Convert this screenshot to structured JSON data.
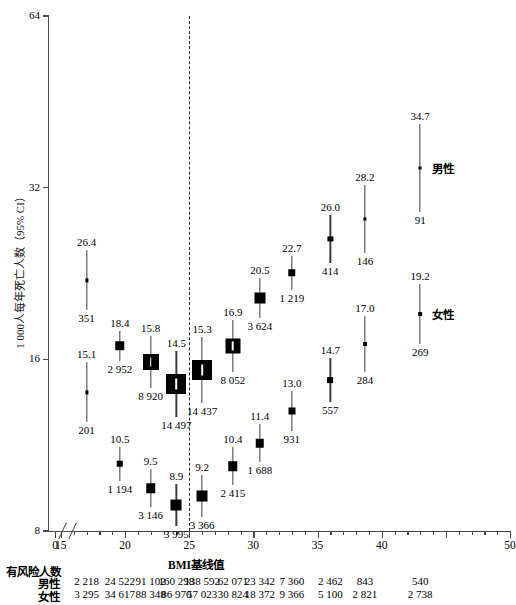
{
  "chart_data": {
    "type": "scatter",
    "title": "",
    "xlabel": "BMI基线值",
    "ylabel": "1 000人每年死亡人数（95% CI）",
    "yscale": "log2",
    "ylim": [
      8,
      64
    ],
    "yticks": [
      8,
      16,
      32,
      64
    ],
    "ytick_labels": [
      "8",
      "16",
      "32",
      "64"
    ],
    "xlim": [
      14,
      50
    ],
    "xticks_major": [
      15,
      20,
      25,
      30,
      35,
      40,
      45,
      50
    ],
    "xtick_labels": [
      "0",
      "15",
      "20",
      "25",
      "30",
      "35",
      "40",
      "",
      "50"
    ],
    "xticks_minor": [
      16,
      17,
      18,
      19,
      21,
      22,
      23,
      24,
      26,
      27,
      28,
      29,
      31,
      32,
      33,
      34,
      36,
      37,
      38,
      39,
      41,
      42,
      43,
      44,
      46,
      47,
      48,
      49
    ],
    "grid": false,
    "axis_break_x": true,
    "reference_line_x": 25,
    "legend_position": "inline-right",
    "series": [
      {
        "name": "男性",
        "points": [
          {
            "x": 17.0,
            "y": 22.0,
            "ci_high_label": "26.4",
            "n_label": "351",
            "box": 3.2
          },
          {
            "x": 19.6,
            "y": 16.9,
            "ci_high_label": "18.4",
            "n_label": "2 952",
            "box": 9.5
          },
          {
            "x": 22.0,
            "y": 15.8,
            "ci_high_label": "15.8",
            "n_label": "8 920",
            "box": 16
          },
          {
            "x": 24.0,
            "y": 14.5,
            "ci_high_label": "14.5",
            "n_label": "14 497",
            "box": 20
          },
          {
            "x": 26.0,
            "y": 15.3,
            "ci_high_label": "15.3",
            "n_label": "14 437",
            "box": 20
          },
          {
            "x": 28.4,
            "y": 16.9,
            "ci_high_label": "16.9",
            "n_label": "8 052",
            "box": 15
          },
          {
            "x": 30.5,
            "y": 20.5,
            "ci_high_label": "20.5",
            "n_label": "3 624",
            "box": 11
          },
          {
            "x": 33.0,
            "y": 22.7,
            "ci_high_label": "22.7",
            "n_label": "1 219",
            "box": 7.5
          },
          {
            "x": 36.0,
            "y": 26.0,
            "ci_high_label": "26.0",
            "n_label": "414",
            "box": 5.2
          },
          {
            "x": 38.7,
            "y": 28.2,
            "ci_high_label": "28.2",
            "n_label": "146",
            "box": 3.2
          },
          {
            "x": 43.0,
            "y": 34.7,
            "ci_high_label": "34.7",
            "n_label": "91",
            "box": 3.0
          }
        ]
      },
      {
        "name": "女性",
        "points": [
          {
            "x": 17.0,
            "y": 14.0,
            "ci_high_label": "15.1",
            "n_label": "201",
            "box": 3.2
          },
          {
            "x": 19.6,
            "y": 10.5,
            "ci_high_label": "10.5",
            "n_label": "1 194",
            "box": 6.5
          },
          {
            "x": 22.0,
            "y": 9.5,
            "ci_high_label": "9.5",
            "n_label": "3 146",
            "box": 9.5
          },
          {
            "x": 24.0,
            "y": 8.9,
            "ci_high_label": "8.9",
            "n_label": "3 995",
            "box": 11
          },
          {
            "x": 26.0,
            "y": 9.2,
            "ci_high_label": "9.2",
            "n_label": "3 366",
            "box": 11
          },
          {
            "x": 28.4,
            "y": 10.4,
            "ci_high_label": "10.4",
            "n_label": "2 415",
            "box": 9.5
          },
          {
            "x": 30.5,
            "y": 11.4,
            "ci_high_label": "11.4",
            "n_label": "1 688",
            "box": 8.5
          },
          {
            "x": 33.0,
            "y": 13.0,
            "ci_high_label": "13.0",
            "n_label": "931",
            "box": 7.0
          },
          {
            "x": 36.0,
            "y": 14.7,
            "ci_high_label": "14.7",
            "n_label": "557",
            "box": 5.8
          },
          {
            "x": 38.7,
            "y": 17.0,
            "ci_high_label": "17.0",
            "n_label": "284",
            "box": 4.0
          },
          {
            "x": 43.0,
            "y": 19.2,
            "ci_high_label": "19.2",
            "n_label": "269",
            "box": 3.8
          }
        ]
      }
    ]
  },
  "at_risk": {
    "title": "有风险人数",
    "rows": [
      {
        "label": "男性",
        "values": [
          "2 218",
          "24 522",
          "91 102",
          "160 298",
          "138 592",
          "62 071",
          "23 342",
          "7 360",
          "2 462",
          "843",
          "540"
        ]
      },
      {
        "label": "女性",
        "values": [
          "3 295",
          "34 617",
          "88 348",
          "86 970",
          "57 023",
          "30 824",
          "18 372",
          "9 366",
          "5 100",
          "2 821",
          "2 738"
        ]
      }
    ]
  },
  "axes": {
    "y_title": "1 000人每年死亡人数（95% CI）",
    "x_title": "BMI基线值",
    "y_tick_labels": [
      "64",
      "32",
      "16",
      "8"
    ],
    "x_tick_labels": [
      "0",
      "15",
      "20",
      "25",
      "30",
      "35",
      "40",
      "50"
    ]
  },
  "series_labels": {
    "male": "男性",
    "female": "女性"
  }
}
